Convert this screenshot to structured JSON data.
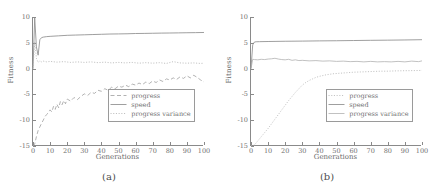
{
  "figure": {
    "panels": [
      {
        "caption": "(a)",
        "chart_data": {
          "type": "line",
          "title": "",
          "xlabel": "Generations",
          "ylabel": "Fitness",
          "xlim": [
            0,
            100
          ],
          "ylim": [
            -15,
            10
          ],
          "xticks": [
            0,
            10,
            20,
            30,
            40,
            50,
            60,
            70,
            80,
            90,
            100
          ],
          "yticks": [
            10,
            5,
            0,
            -5,
            -10,
            -15
          ],
          "ytick_labels": [
            "10",
            "5",
            "0",
            "-5",
            "-10",
            "-15"
          ],
          "grid": false,
          "legend_position": "lower-right",
          "series": [
            {
              "name": "progress",
              "style": "dashed",
              "color": "#9e9e9e",
              "x": [
                0,
                1,
                2,
                3,
                4,
                5,
                6,
                7,
                8,
                9,
                10,
                11,
                12,
                13,
                14,
                15,
                16,
                17,
                18,
                19,
                20,
                22,
                24,
                26,
                28,
                30,
                32,
                34,
                36,
                38,
                40,
                42,
                44,
                46,
                48,
                50,
                52,
                54,
                56,
                58,
                60,
                62,
                64,
                66,
                68,
                70,
                72,
                74,
                76,
                78,
                80,
                82,
                84,
                86,
                88,
                90,
                92,
                94,
                96,
                98,
                100
              ],
              "values": [
                -15.0,
                -14.6,
                -13.2,
                -12.0,
                -11.3,
                -10.6,
                -10.0,
                -9.3,
                -8.9,
                -8.5,
                -8.0,
                -8.4,
                -7.3,
                -7.9,
                -6.9,
                -7.6,
                -6.4,
                -7.0,
                -6.2,
                -6.8,
                -5.9,
                -6.3,
                -5.6,
                -6.0,
                -5.4,
                -4.9,
                -5.2,
                -4.6,
                -4.8,
                -4.2,
                -4.4,
                -3.9,
                -4.2,
                -3.6,
                -3.9,
                -3.4,
                -3.6,
                -3.2,
                -3.5,
                -3.0,
                -3.2,
                -2.8,
                -3.1,
                -2.6,
                -2.9,
                -2.4,
                -2.7,
                -2.2,
                -2.5,
                -2.0,
                -2.2,
                -1.8,
                -2.1,
                -1.6,
                -1.9,
                -1.4,
                -1.8,
                -1.3,
                -1.7,
                -2.2,
                -2.6
              ]
            },
            {
              "name": "speed",
              "style": "solid",
              "color": "#8e8e8e",
              "x": [
                0,
                1,
                2,
                3,
                4,
                5,
                6,
                8,
                10,
                15,
                20,
                25,
                30,
                35,
                40,
                45,
                50,
                55,
                60,
                65,
                70,
                75,
                80,
                85,
                90,
                95,
                100
              ],
              "values": [
                0.0,
                9.8,
                4.2,
                2.6,
                5.6,
                6.0,
                6.1,
                6.2,
                6.25,
                6.35,
                6.45,
                6.5,
                6.55,
                6.6,
                6.65,
                6.7,
                6.72,
                6.75,
                6.8,
                6.82,
                6.85,
                6.88,
                6.9,
                6.92,
                6.95,
                6.97,
                7.0
              ]
            },
            {
              "name": "progress variance",
              "style": "dotted",
              "color": "#b0b0b0",
              "x": [
                0,
                1,
                2,
                3,
                4,
                5,
                6,
                8,
                10,
                14,
                18,
                22,
                26,
                30,
                34,
                38,
                42,
                46,
                50,
                54,
                58,
                62,
                66,
                70,
                74,
                78,
                82,
                86,
                90,
                94,
                98,
                100
              ],
              "values": [
                0.0,
                5.2,
                2.0,
                1.2,
                1.5,
                1.3,
                1.45,
                1.3,
                1.4,
                1.25,
                1.35,
                1.2,
                1.3,
                1.2,
                1.3,
                1.15,
                1.25,
                1.1,
                1.2,
                1.1,
                1.2,
                1.05,
                1.15,
                1.05,
                1.15,
                1.0,
                1.35,
                1.1,
                1.05,
                1.1,
                1.0,
                1.05
              ]
            }
          ]
        }
      },
      {
        "caption": "(b)",
        "chart_data": {
          "type": "line",
          "title": "",
          "xlabel": "Generations",
          "ylabel": "Fitness",
          "xlim": [
            0,
            100
          ],
          "ylim": [
            -15,
            10
          ],
          "xticks": [
            0,
            10,
            20,
            30,
            40,
            50,
            60,
            70,
            80,
            90,
            100
          ],
          "yticks": [
            10,
            5,
            0,
            -5,
            -10,
            -15
          ],
          "ytick_labels": [
            "10",
            "5",
            "0",
            "-5",
            "-10",
            "-15"
          ],
          "grid": false,
          "legend_position": "lower-right",
          "series": [
            {
              "name": "progress",
              "style": "dotted",
              "color": "#b4b4b4",
              "x": [
                0,
                2,
                4,
                6,
                8,
                10,
                12,
                14,
                16,
                18,
                20,
                22,
                24,
                26,
                28,
                30,
                32,
                34,
                36,
                38,
                40,
                44,
                48,
                52,
                56,
                60,
                64,
                68,
                72,
                76,
                80,
                84,
                88,
                92,
                96,
                100
              ],
              "values": [
                -15.0,
                -14.8,
                -14.0,
                -13.2,
                -12.4,
                -11.6,
                -10.7,
                -9.8,
                -8.9,
                -8.0,
                -7.1,
                -6.2,
                -5.4,
                -4.6,
                -3.9,
                -3.2,
                -2.7,
                -2.3,
                -2.0,
                -1.7,
                -1.5,
                -1.2,
                -1.0,
                -0.9,
                -0.8,
                -0.7,
                -0.65,
                -0.6,
                -0.55,
                -0.5,
                -0.5,
                -0.45,
                -0.42,
                -0.4,
                -0.38,
                -0.35
              ]
            },
            {
              "name": "speed",
              "style": "solid",
              "color": "#8e8e8e",
              "x": [
                0,
                1,
                2,
                3,
                5,
                10,
                20,
                30,
                40,
                50,
                60,
                70,
                80,
                90,
                100
              ],
              "values": [
                0.0,
                4.6,
                5.15,
                5.2,
                5.22,
                5.25,
                5.3,
                5.33,
                5.37,
                5.4,
                5.44,
                5.48,
                5.51,
                5.55,
                5.6
              ]
            },
            {
              "name": "progress variance",
              "style": "solid-thin",
              "color": "#acacac",
              "x": [
                0,
                1,
                2,
                4,
                6,
                8,
                10,
                12,
                14,
                16,
                18,
                20,
                22,
                24,
                26,
                28,
                30,
                34,
                38,
                42,
                46,
                50,
                54,
                58,
                62,
                66,
                70,
                74,
                78,
                82,
                86,
                90,
                94,
                98,
                100
              ],
              "values": [
                0.0,
                1.8,
                1.75,
                1.7,
                1.8,
                1.75,
                1.85,
                1.9,
                2.0,
                1.85,
                1.75,
                1.7,
                1.8,
                1.6,
                1.7,
                1.55,
                1.6,
                1.5,
                1.55,
                1.45,
                1.5,
                1.4,
                1.45,
                1.35,
                1.4,
                1.3,
                1.4,
                1.3,
                1.35,
                1.3,
                1.4,
                1.3,
                1.45,
                1.35,
                1.5
              ]
            }
          ]
        }
      }
    ]
  }
}
